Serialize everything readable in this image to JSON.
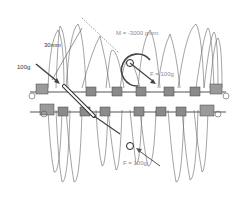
{
  "diagram": {
    "labels": {
      "length": "30mm",
      "applied_force": "100g",
      "moment": "M = -3000 gmm",
      "upper_force": "F = 100g",
      "lower_force": "F = 100g"
    },
    "colors": {
      "tooth_outline": "#666666",
      "wire": "#555555",
      "bracket": "#7a7a7a",
      "arrow": "#444444",
      "label": "#333333",
      "label_light": "#8a8a8a",
      "background": "#ffffff"
    }
  }
}
